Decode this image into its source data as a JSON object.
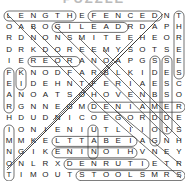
{
  "title": "PUZZLE",
  "grid": {
    "rows": [
      "LENGTHEFENCEDNT",
      "OABOGILEADRDAPH",
      "RDNONSMITEEHEOR",
      "DRKDOREEMYSOTSE",
      "IEREORANOAPGSSE",
      "FKNODFARBLKIDES",
      "EIDEHNTFERIAESC",
      "ANOATSOHOVENBSO",
      "RGNNEGMDENIAMER",
      "HDUDNICOEGORDDE",
      "IONIENIUTLIIOTS",
      "MMKELTTABEIAGNH",
      "NGIKENINOIHVNEY",
      "ONLRXDENRUTIETR",
      "TIMOUTSTOOLSMRS"
    ]
  },
  "found_words_visible": [
    "LENGTH",
    "FENCED",
    "GILEAD",
    "REOR",
    "DENIAM",
    "ENIN",
    "DENRUT",
    "STOOLS",
    "ELTTAB",
    "THREE",
    "SEES",
    "ESCO"
  ]
}
